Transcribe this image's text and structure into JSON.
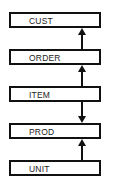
{
  "diagram": {
    "nodes": [
      {
        "id": "cust",
        "label": "CUST"
      },
      {
        "id": "order",
        "label": "ORDER"
      },
      {
        "id": "item",
        "label": "ITEM"
      },
      {
        "id": "prod",
        "label": "PROD"
      },
      {
        "id": "unit",
        "label": "UNIT"
      }
    ],
    "edges": [
      {
        "from": "order",
        "to": "cust",
        "direction": "up"
      },
      {
        "from": "item",
        "to": "order",
        "direction": "up"
      },
      {
        "from": "item",
        "to": "prod",
        "direction": "down"
      },
      {
        "from": "unit",
        "to": "prod",
        "direction": "up"
      }
    ]
  }
}
